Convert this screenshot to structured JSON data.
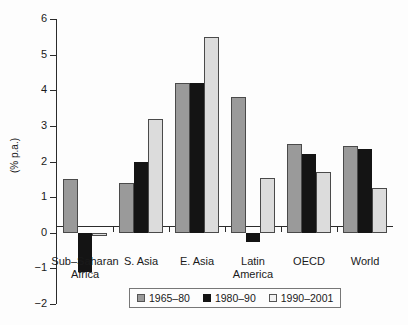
{
  "chart_data": {
    "type": "bar",
    "title": "",
    "xlabel": "",
    "ylabel": "(% p.a.)",
    "ylim": [
      -2,
      6
    ],
    "yticks": [
      6,
      5,
      4,
      3,
      2,
      1,
      0,
      -1,
      -2
    ],
    "ytick_labels": [
      "6",
      "5",
      "4",
      "3",
      "2",
      "1",
      "0",
      "-1",
      "-2"
    ],
    "grid": false,
    "legend_position": "bottom-center",
    "categories": [
      "Sub-Saharan Africa",
      "S. Asia",
      "E. Asia",
      "Latin America",
      "OECD",
      "World"
    ],
    "category_lines": [
      [
        "Sub–Saharan",
        "Africa"
      ],
      [
        "S. Asia"
      ],
      [
        "E. Asia"
      ],
      [
        "Latin",
        "America"
      ],
      [
        "OECD"
      ],
      [
        "World"
      ]
    ],
    "series": [
      {
        "name": "1965–80",
        "color": "#9a9a9a",
        "values": [
          1.5,
          1.4,
          4.2,
          3.8,
          2.5,
          2.45
        ]
      },
      {
        "name": "1980–90",
        "color": "#141414",
        "values": [
          -1.1,
          2.0,
          4.2,
          -0.25,
          2.2,
          2.35
        ]
      },
      {
        "name": "1990–2001",
        "color": "#f2f2f2",
        "values": [
          -0.1,
          3.2,
          5.5,
          1.55,
          1.7,
          1.25
        ]
      }
    ]
  },
  "legend": {
    "items": [
      {
        "label": "1965–80",
        "swatch": "swatch-gray"
      },
      {
        "label": "1980–90",
        "swatch": "swatch-black"
      },
      {
        "label": "1990–2001",
        "swatch": "swatch-white"
      }
    ]
  },
  "axis": {
    "y_title": "(% p.a.)"
  }
}
